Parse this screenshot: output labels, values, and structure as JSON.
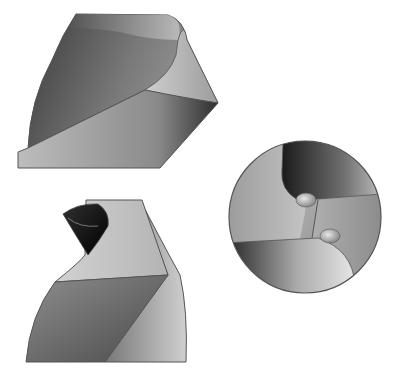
{
  "figure": {
    "views": [
      {
        "id": "side-view",
        "label": ""
      },
      {
        "id": "front-view",
        "label": ""
      },
      {
        "id": "end-view",
        "label": ""
      }
    ],
    "colors": {
      "background": "#ffffff",
      "outline": "#555555",
      "dark": "#2a2a2a",
      "mid": "#808080",
      "light": "#d8d8d8"
    }
  }
}
